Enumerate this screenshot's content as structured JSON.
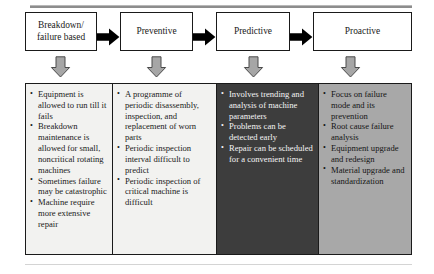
{
  "figure": {
    "colors": {
      "box_border": "#1a1a1a",
      "arrow_right_fill": "#000000",
      "arrow_down_fill": "#a6a6a6",
      "column_light": "#f2f2f0",
      "column_dark": "#3d3d3d",
      "column_gray": "#a8a8a8",
      "dark_column_text": "#f4f4f4"
    }
  },
  "stages": [
    {
      "id": "breakdown",
      "label_line1": "Breakdown/",
      "label_line2": "failure based"
    },
    {
      "id": "preventive",
      "label_line1": "Preventive",
      "label_line2": ""
    },
    {
      "id": "predictive",
      "label_line1": "Predictive",
      "label_line2": ""
    },
    {
      "id": "proactive",
      "label_line1": "Proactive",
      "label_line2": ""
    }
  ],
  "connectors": {
    "right_arrow_icon": "arrow-right-icon",
    "down_arrow_icon": "arrow-down-icon",
    "right_arrow_count": 3,
    "down_arrow_count": 4
  },
  "details": [
    {
      "stage": "breakdown",
      "items": [
        "Equipment is allowed to run till it fails",
        "Breakdown maintenance is allowed for small, noncritical rotating machines",
        "Sometimes failure may be catastrophic",
        "Machine require more extensive repair"
      ]
    },
    {
      "stage": "preventive",
      "items": [
        "A programme of periodic disassembly, inspection, and replacement of worn parts",
        "Periodic inspection interval difficult to predict",
        "Periodic inspection of critical machine is difficult"
      ]
    },
    {
      "stage": "predictive",
      "items": [
        "Involves trending and analysis of machine parameters",
        "Problems can be detected early",
        "Repair can be scheduled for a convenient time"
      ]
    },
    {
      "stage": "proactive",
      "items": [
        "Focus on failure mode and its prevention",
        "Root cause failure analysis",
        "Equipment upgrade and redesign",
        "Material upgrade and standardization"
      ]
    }
  ]
}
